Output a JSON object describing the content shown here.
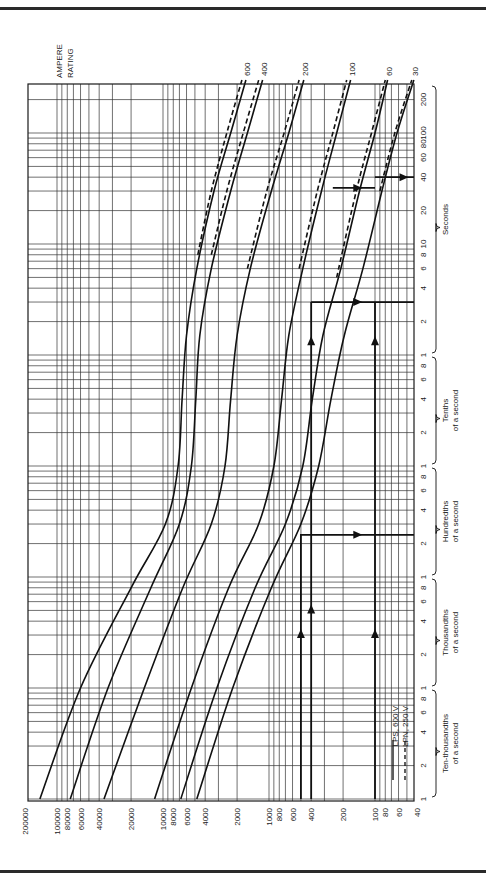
{
  "chart_data": {
    "type": "line",
    "orientation": "rotated-90-clockwise",
    "title": "",
    "ylabel_title": [
      "AMPERE",
      "RATING"
    ],
    "xaxis": {
      "name": "current",
      "unit": "A",
      "scale": "log",
      "range": [
        200000,
        40
      ],
      "ticks": [
        200000,
        100000,
        80000,
        60000,
        40000,
        20000,
        10000,
        8000,
        6000,
        4000,
        2000,
        1000,
        800,
        600,
        400,
        200,
        100,
        80,
        60,
        40
      ],
      "tick_labels": [
        "200000",
        "100000",
        "80000",
        "60000",
        "40000",
        "20000",
        "10000",
        "8000",
        "6000",
        "4000",
        "2000",
        "1000",
        "800",
        "600",
        "400",
        "200",
        "100",
        "80",
        "60",
        "40"
      ]
    },
    "yaxis": {
      "name": "time",
      "unit": "s",
      "scale": "log",
      "range": [
        0.0001,
        300
      ],
      "tick_labels": [
        {
          "t": 0.0001,
          "label": "1"
        },
        {
          "t": 0.0002,
          "label": "2"
        },
        {
          "t": 0.0004,
          "label": "4"
        },
        {
          "t": 0.0006,
          "label": "6"
        },
        {
          "t": 0.0008,
          "label": "8"
        },
        {
          "t": 0.001,
          "label": "1"
        },
        {
          "t": 0.002,
          "label": "2"
        },
        {
          "t": 0.004,
          "label": "4"
        },
        {
          "t": 0.006,
          "label": "6"
        },
        {
          "t": 0.008,
          "label": "8"
        },
        {
          "t": 0.01,
          "label": "1"
        },
        {
          "t": 0.02,
          "label": "2"
        },
        {
          "t": 0.04,
          "label": "4"
        },
        {
          "t": 0.06,
          "label": "6"
        },
        {
          "t": 0.08,
          "label": "8"
        },
        {
          "t": 0.1,
          "label": "1"
        },
        {
          "t": 0.2,
          "label": "2"
        },
        {
          "t": 0.4,
          "label": "4"
        },
        {
          "t": 0.6,
          "label": "6"
        },
        {
          "t": 0.8,
          "label": "8"
        },
        {
          "t": 1,
          "label": "1"
        },
        {
          "t": 2,
          "label": "2"
        },
        {
          "t": 4,
          "label": "4"
        },
        {
          "t": 6,
          "label": "6"
        },
        {
          "t": 8,
          "label": "8"
        },
        {
          "t": 10,
          "label": "10"
        },
        {
          "t": 20,
          "label": "20"
        },
        {
          "t": 40,
          "label": "40"
        },
        {
          "t": 60,
          "label": "60"
        },
        {
          "t": 80,
          "label": "80"
        },
        {
          "t": 100,
          "label": "100"
        },
        {
          "t": 200,
          "label": "200"
        }
      ],
      "groups": [
        {
          "label": [
            "Ten-thousandths",
            "of a second"
          ],
          "from": 0.0001,
          "to": 0.001
        },
        {
          "label": [
            "Thousandths",
            "of a second"
          ],
          "from": 0.001,
          "to": 0.01
        },
        {
          "label": [
            "Hundredths",
            "of a second"
          ],
          "from": 0.01,
          "to": 0.1
        },
        {
          "label": [
            "Tenths",
            "of a second"
          ],
          "from": 0.1,
          "to": 1
        },
        {
          "label": [
            "Seconds"
          ],
          "from": 1,
          "to": 300
        }
      ]
    },
    "grid": true,
    "legend": {
      "placement": "bottom-right",
      "entries": [
        {
          "label": "LPS, 600 V",
          "style": "solid"
        },
        {
          "label": "LPN, 250 V",
          "style": "dashed"
        }
      ]
    },
    "series": [
      {
        "name": "600",
        "style": "solid",
        "points": [
          [
            145000,
            0.0001
          ],
          [
            60000,
            0.001
          ],
          [
            20000,
            0.008
          ],
          [
            9500,
            0.03
          ],
          [
            7200,
            0.1
          ],
          [
            6600,
            0.4
          ],
          [
            6000,
            1.5
          ],
          [
            4800,
            6
          ],
          [
            3300,
            30
          ],
          [
            2300,
            100
          ],
          [
            1650,
            300
          ]
        ]
      },
      {
        "name": "600",
        "style": "dashed",
        "points": [
          [
            4700,
            8
          ],
          [
            3500,
            30
          ],
          [
            2500,
            100
          ],
          [
            1800,
            300
          ]
        ]
      },
      {
        "name": "400",
        "style": "solid",
        "points": [
          [
            75000,
            0.0001
          ],
          [
            33000,
            0.001
          ],
          [
            13000,
            0.008
          ],
          [
            7000,
            0.03
          ],
          [
            5400,
            0.1
          ],
          [
            4900,
            0.4
          ],
          [
            4500,
            1.5
          ],
          [
            3500,
            6
          ],
          [
            2300,
            30
          ],
          [
            1600,
            100
          ],
          [
            1150,
            300
          ]
        ]
      },
      {
        "name": "400",
        "style": "dashed",
        "points": [
          [
            3500,
            8
          ],
          [
            2500,
            30
          ],
          [
            1750,
            100
          ],
          [
            1250,
            300
          ]
        ]
      },
      {
        "name": "200",
        "style": "solid",
        "points": [
          [
            36000,
            0.0001
          ],
          [
            15000,
            0.001
          ],
          [
            6500,
            0.008
          ],
          [
            3500,
            0.03
          ],
          [
            2600,
            0.1
          ],
          [
            2300,
            0.4
          ],
          [
            2000,
            1.5
          ],
          [
            1500,
            6
          ],
          [
            950,
            30
          ],
          [
            650,
            100
          ],
          [
            470,
            300
          ]
        ]
      },
      {
        "name": "200",
        "style": "dashed",
        "points": [
          [
            1600,
            6
          ],
          [
            1050,
            30
          ],
          [
            720,
            100
          ],
          [
            520,
            300
          ]
        ]
      },
      {
        "name": "100",
        "style": "solid",
        "points": [
          [
            12000,
            0.0001
          ],
          [
            5400,
            0.001
          ],
          [
            2400,
            0.008
          ],
          [
            1250,
            0.03
          ],
          [
            900,
            0.1
          ],
          [
            760,
            0.4
          ],
          [
            650,
            1.5
          ],
          [
            480,
            6
          ],
          [
            320,
            30
          ],
          [
            230,
            100
          ],
          [
            170,
            300
          ]
        ]
      },
      {
        "name": "100",
        "style": "dashed",
        "points": [
          [
            520,
            6
          ],
          [
            350,
            30
          ],
          [
            250,
            100
          ],
          [
            185,
            300
          ]
        ]
      },
      {
        "name": "60",
        "style": "solid",
        "points": [
          [
            6800,
            0.0001
          ],
          [
            3100,
            0.001
          ],
          [
            1350,
            0.008
          ],
          [
            700,
            0.03
          ],
          [
            480,
            0.1
          ],
          [
            390,
            0.4
          ],
          [
            310,
            1.5
          ],
          [
            210,
            6
          ],
          [
            140,
            30
          ],
          [
            100,
            100
          ],
          [
            76,
            300
          ]
        ]
      },
      {
        "name": "60",
        "style": "dashed",
        "points": [
          [
            230,
            5
          ],
          [
            150,
            30
          ],
          [
            108,
            100
          ],
          [
            80,
            300
          ]
        ]
      },
      {
        "name": "30",
        "style": "solid",
        "points": [
          [
            4800,
            0.0001
          ],
          [
            2200,
            0.001
          ],
          [
            950,
            0.008
          ],
          [
            500,
            0.03
          ],
          [
            340,
            0.1
          ],
          [
            260,
            0.4
          ],
          [
            195,
            1.5
          ],
          [
            130,
            6
          ],
          [
            86,
            30
          ],
          [
            62,
            100
          ],
          [
            43,
            300
          ]
        ]
      },
      {
        "name": "30",
        "style": "dashed",
        "points": [
          [
            90,
            30
          ],
          [
            65,
            100
          ],
          [
            45,
            300
          ]
        ]
      }
    ],
    "annotations": [
      {
        "type": "arrow-path",
        "points": [
          [
            500,
            0.0001
          ],
          [
            500,
            0.024
          ],
          [
            40,
            0.024
          ]
        ],
        "arrows": [
          [
            500,
            0.003
          ],
          [
            150,
            0.024
          ]
        ]
      },
      {
        "type": "arrow-path",
        "points": [
          [
            400,
            0.0001
          ],
          [
            400,
            3.0
          ]
        ],
        "arrows": [
          [
            400,
            0.005
          ],
          [
            400,
            1.3
          ]
        ]
      },
      {
        "type": "arrow-path",
        "points": [
          [
            360,
            3.0
          ],
          [
            400,
            3.0
          ],
          [
            40,
            3.0
          ]
        ],
        "arrows": [
          [
            150,
            3.0
          ]
        ]
      },
      {
        "type": "arrow-path",
        "points": [
          [
            100,
            0.0001
          ],
          [
            100,
            3.0
          ]
        ],
        "arrows": [
          [
            100,
            0.003
          ],
          [
            100,
            1.3
          ]
        ]
      },
      {
        "type": "arrow-path",
        "points": [
          [
            100,
            40
          ],
          [
            40,
            40
          ]
        ],
        "arrows": [
          [
            55,
            40
          ]
        ]
      },
      {
        "type": "arrow-path",
        "points": [
          [
            250,
            32
          ],
          [
            100,
            32
          ]
        ],
        "arrows": [
          [
            150,
            32
          ]
        ]
      }
    ]
  }
}
